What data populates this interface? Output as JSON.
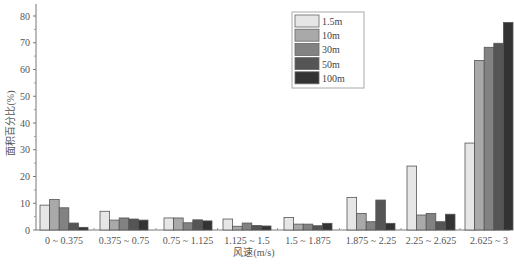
{
  "chart_data": {
    "type": "bar",
    "title": "",
    "xlabel": "风速(m/s)",
    "ylabel": "面积百分比(%)",
    "ylim": [
      0,
      84
    ],
    "yticks": [
      0,
      10,
      20,
      30,
      40,
      50,
      60,
      70,
      80
    ],
    "grid": false,
    "legend_position": "top-center-right",
    "categories": [
      "0 ~ 0.375",
      "0.375 ~ 0.75",
      "0.75 ~ 1.125",
      "1.125 ~ 1.5",
      "1.5 ~ 1.875",
      "1.875 ~ 2.25",
      "2.25 ~ 2.625",
      "2.625 ~ 3"
    ],
    "series": [
      {
        "name": "1.5m",
        "color": "#e6e6e6",
        "values": [
          9.3,
          7.0,
          4.5,
          4.1,
          4.7,
          12.2,
          23.9,
          32.5
        ]
      },
      {
        "name": "10m",
        "color": "#a9a9a9",
        "values": [
          11.4,
          3.7,
          4.5,
          1.4,
          2.2,
          6.2,
          5.6,
          63.4
        ]
      },
      {
        "name": "30m",
        "color": "#828282",
        "values": [
          8.3,
          4.5,
          2.7,
          2.6,
          2.2,
          3.1,
          6.2,
          68.3
        ]
      },
      {
        "name": "50m",
        "color": "#555555",
        "values": [
          2.6,
          4.1,
          3.8,
          1.7,
          1.6,
          11.2,
          3.1,
          69.8
        ]
      },
      {
        "name": "100m",
        "color": "#333333",
        "values": [
          1.0,
          3.7,
          3.4,
          1.5,
          2.5,
          2.5,
          5.9,
          77.6
        ]
      }
    ]
  }
}
